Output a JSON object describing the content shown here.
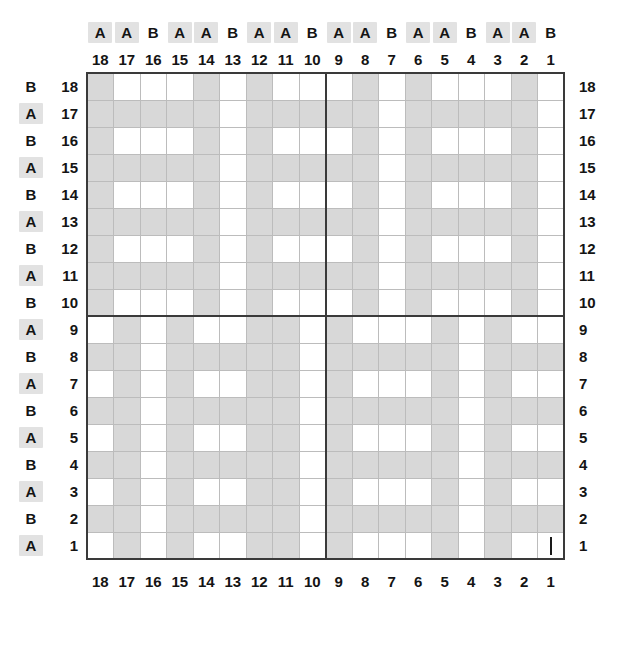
{
  "chart_data": {
    "type": "heatmap",
    "title": "",
    "xlabel": "",
    "ylabel": "",
    "grid": true,
    "legend": "none",
    "filled_color": "#d8d8d8",
    "empty_color": "#ffffff",
    "columns": 18,
    "rows": 18,
    "x_tick_labels_top": [
      "18",
      "17",
      "16",
      "15",
      "14",
      "13",
      "12",
      "11",
      "10",
      "9",
      "8",
      "7",
      "6",
      "5",
      "4",
      "3",
      "2",
      "1"
    ],
    "x_tick_labels_bottom": [
      "18",
      "17",
      "16",
      "15",
      "14",
      "13",
      "12",
      "11",
      "10",
      "9",
      "8",
      "7",
      "6",
      "5",
      "4",
      "3",
      "2",
      "1"
    ],
    "x_group_labels": [
      "A",
      "A",
      "B",
      "A",
      "A",
      "B",
      "A",
      "A",
      "B",
      "A",
      "A",
      "B",
      "A",
      "A",
      "B",
      "A",
      "A",
      "B"
    ],
    "x_group_highlight": [
      true,
      true,
      false,
      true,
      true,
      false,
      true,
      true,
      false,
      true,
      true,
      false,
      true,
      true,
      false,
      true,
      true,
      false
    ],
    "y_tick_labels_left": [
      "18",
      "17",
      "16",
      "15",
      "14",
      "13",
      "12",
      "11",
      "10",
      "9",
      "8",
      "7",
      "6",
      "5",
      "4",
      "3",
      "2",
      "1"
    ],
    "y_tick_labels_right": [
      "18",
      "17",
      "16",
      "15",
      "14",
      "13",
      "12",
      "11",
      "10",
      "9",
      "8",
      "7",
      "6",
      "5",
      "4",
      "3",
      "2",
      "1"
    ],
    "y_group_labels": [
      "B",
      "A",
      "B",
      "A",
      "B",
      "A",
      "B",
      "A",
      "B",
      "A",
      "B",
      "A",
      "B",
      "A",
      "B",
      "A",
      "B",
      "A"
    ],
    "y_group_highlight": [
      false,
      true,
      false,
      true,
      false,
      true,
      false,
      true,
      false,
      true,
      false,
      true,
      false,
      true,
      false,
      true,
      false,
      true
    ],
    "heavy_divider_after_column_index": 8,
    "heavy_divider_after_row_index": 8,
    "tick_mark_cell": {
      "row": 1,
      "column": 1
    },
    "matrix_row_order": [
      "18",
      "17",
      "16",
      "15",
      "14",
      "13",
      "12",
      "11",
      "10",
      "9",
      "8",
      "7",
      "6",
      "5",
      "4",
      "3",
      "2",
      "1"
    ],
    "matrix_column_order": [
      "18",
      "17",
      "16",
      "15",
      "14",
      "13",
      "12",
      "11",
      "10",
      "9",
      "8",
      "7",
      "6",
      "5",
      "4",
      "3",
      "2",
      "1"
    ],
    "matrix": [
      [
        1,
        0,
        0,
        0,
        1,
        0,
        1,
        0,
        0,
        0,
        1,
        0,
        1,
        0,
        0,
        0,
        1,
        0
      ],
      [
        1,
        1,
        1,
        1,
        1,
        0,
        1,
        1,
        1,
        1,
        1,
        0,
        1,
        1,
        1,
        1,
        1,
        0
      ],
      [
        1,
        0,
        0,
        0,
        1,
        0,
        1,
        0,
        0,
        0,
        1,
        0,
        1,
        0,
        0,
        0,
        1,
        0
      ],
      [
        1,
        1,
        1,
        1,
        1,
        0,
        1,
        1,
        1,
        1,
        1,
        0,
        1,
        1,
        1,
        1,
        1,
        0
      ],
      [
        1,
        0,
        0,
        0,
        1,
        0,
        1,
        0,
        0,
        0,
        1,
        0,
        1,
        0,
        0,
        0,
        1,
        0
      ],
      [
        1,
        1,
        1,
        1,
        1,
        0,
        1,
        1,
        1,
        1,
        1,
        0,
        1,
        1,
        1,
        1,
        1,
        0
      ],
      [
        1,
        0,
        0,
        0,
        1,
        0,
        1,
        0,
        0,
        0,
        1,
        0,
        1,
        0,
        0,
        0,
        1,
        0
      ],
      [
        1,
        1,
        1,
        1,
        1,
        0,
        1,
        1,
        1,
        1,
        1,
        0,
        1,
        1,
        1,
        1,
        1,
        0
      ],
      [
        1,
        0,
        0,
        0,
        1,
        0,
        1,
        0,
        0,
        0,
        1,
        0,
        1,
        0,
        0,
        0,
        1,
        0
      ],
      [
        0,
        1,
        0,
        1,
        0,
        0,
        1,
        1,
        0,
        1,
        0,
        0,
        0,
        1,
        0,
        1,
        0,
        0
      ],
      [
        1,
        1,
        0,
        1,
        1,
        1,
        1,
        1,
        0,
        1,
        1,
        1,
        1,
        1,
        0,
        1,
        1,
        1
      ],
      [
        0,
        1,
        0,
        1,
        0,
        0,
        1,
        1,
        0,
        1,
        0,
        0,
        0,
        1,
        0,
        1,
        0,
        0
      ],
      [
        1,
        1,
        0,
        1,
        1,
        1,
        1,
        1,
        0,
        1,
        1,
        1,
        1,
        1,
        0,
        1,
        1,
        1
      ],
      [
        0,
        1,
        0,
        1,
        0,
        0,
        1,
        1,
        0,
        1,
        0,
        0,
        0,
        1,
        0,
        1,
        0,
        0
      ],
      [
        1,
        1,
        0,
        1,
        1,
        1,
        1,
        1,
        0,
        1,
        1,
        1,
        1,
        1,
        0,
        1,
        1,
        1
      ],
      [
        0,
        1,
        0,
        1,
        0,
        0,
        1,
        1,
        0,
        1,
        0,
        0,
        0,
        1,
        0,
        1,
        0,
        0
      ],
      [
        1,
        1,
        0,
        1,
        1,
        1,
        1,
        1,
        0,
        1,
        1,
        1,
        1,
        1,
        0,
        1,
        1,
        1
      ],
      [
        0,
        1,
        0,
        1,
        0,
        0,
        1,
        1,
        0,
        1,
        0,
        0,
        0,
        1,
        0,
        1,
        0,
        0
      ]
    ]
  }
}
